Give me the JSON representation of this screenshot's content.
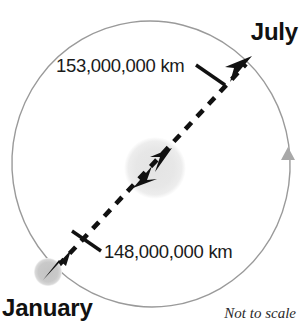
{
  "diagram": {
    "caption": "Not to scale",
    "colors": {
      "background": "#ffffff",
      "orbit_line": "#9a9a9a",
      "sun_fill": "#e6e6e6",
      "planet_fill": "#c9c9c9",
      "dashed_line": "#111111",
      "text": "#111111",
      "direction_marker": "#a8a8a8"
    },
    "labels": {
      "july": "July",
      "january": "January",
      "aphelion_distance": "153,000,000 km",
      "perihelion_distance": "148,000,000 km"
    },
    "orbit": {
      "shape": "ellipse",
      "center_x": 151,
      "center_y": 164,
      "radius_x": 139,
      "radius_y": 143,
      "rotation_deg": -8,
      "stroke_width": 1.4,
      "direction_marker_angle": "right side, pointing counterclockwise"
    },
    "sun": {
      "name": "Sun",
      "center_x": 155,
      "center_y": 168,
      "radius": 29
    },
    "planets": [
      {
        "name": "Earth in January",
        "month": "January",
        "center_x": 48,
        "center_y": 272,
        "radius": 13,
        "note": "perihelion - closest point"
      },
      {
        "name": "Earth in July",
        "month": "July",
        "center_x": 248,
        "center_y": 62,
        "radius": 0,
        "note": "aphelion - farthest point"
      }
    ],
    "axis_line": {
      "style": "dashed double-headed arrow",
      "from_x": 58,
      "from_y": 266,
      "to_x": 246,
      "to_y": 64,
      "dash_pattern": "9 8",
      "stroke_width": 4.5
    },
    "leaders": [
      {
        "name": "aphelion-leader",
        "from_x": 196,
        "from_y": 66,
        "to_x": 224,
        "to_y": 84
      },
      {
        "name": "perihelion-leader",
        "from_x": 99,
        "from_y": 250,
        "to_x": 73,
        "to_y": 232
      }
    ]
  }
}
